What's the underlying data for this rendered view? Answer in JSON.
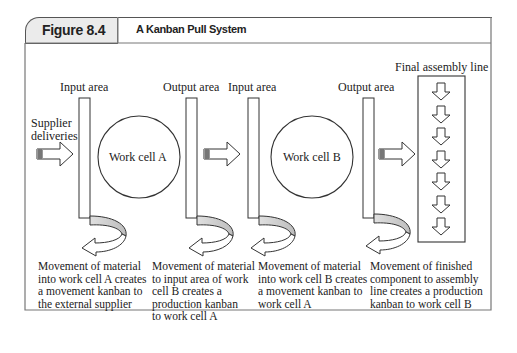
{
  "figure": {
    "label": "Figure 8.4",
    "title": "A Kanban Pull System"
  },
  "diagram": {
    "labels": {
      "input_area_a": "Input area",
      "output_area_a": "Output area",
      "input_area_b": "Input area",
      "output_area_b": "Output area",
      "final_assembly": "Final assembly line",
      "supplier_line1": "Supplier",
      "supplier_line2": "deliveries",
      "work_cell_a": "Work cell A",
      "work_cell_b": "Work cell B"
    },
    "captions": [
      "Movement of material\ninto work cell A creates\na movement kanban to\nthe external supplier",
      "Movement of material\nto input area of work\ncell B creates a\nproduction kanban\nto work cell A",
      "Movement of material\ninto work cell B creates\na movement kanban  to\nwork cell A",
      "Movement of finished\ncomponent to assembly\nline creates a production\nkanban to work cell B"
    ],
    "assembly_arrow_count": 6,
    "colors": {
      "header_bg": "#ebebeb",
      "curve_fill": "#c8c8c8",
      "stroke": "#333333"
    }
  }
}
